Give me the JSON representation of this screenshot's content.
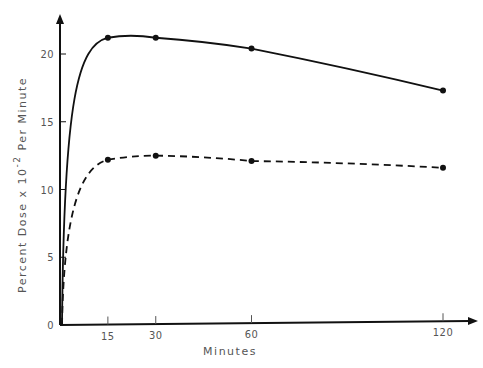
{
  "chart_data": {
    "type": "line",
    "title": "",
    "xlabel": "Minutes",
    "ylabel": "Percent Dose x 10^-2 Per Minute",
    "ylabel_parts": {
      "main": "Percent Dose x 10",
      "superscript": "-2",
      "suffix": " Per Minute"
    },
    "x_ticks": [
      15,
      30,
      60,
      120
    ],
    "y_ticks": [
      0,
      5,
      10,
      15,
      20
    ],
    "xlim": [
      0,
      120
    ],
    "ylim": [
      0,
      22
    ],
    "grid": false,
    "legend": null,
    "series": [
      {
        "name": "solid curve",
        "style": "solid",
        "x": [
          15,
          30,
          60,
          120
        ],
        "values": [
          21.2,
          21.2,
          20.4,
          17.3
        ]
      },
      {
        "name": "dashed curve",
        "style": "dashed",
        "x": [
          15,
          30,
          60,
          120
        ],
        "values": [
          12.2,
          12.5,
          12.1,
          11.6
        ]
      }
    ]
  },
  "colors": {
    "line": "#111111",
    "text": "#555555"
  }
}
